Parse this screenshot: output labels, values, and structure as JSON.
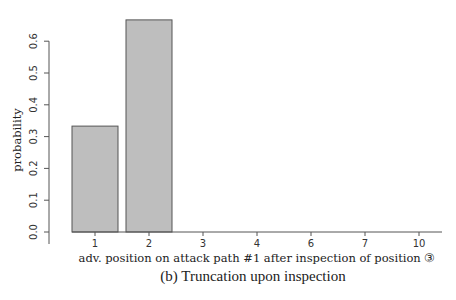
{
  "chart_data": {
    "type": "bar",
    "title": "",
    "caption": "(b) Truncation upon inspection",
    "xlabel": "adv. position on attack path #1 after inspection of position ③",
    "ylabel": "probability",
    "categories": [
      "1",
      "2",
      "3",
      "4",
      "6",
      "7",
      "10"
    ],
    "values": [
      0.333,
      0.667,
      0,
      0,
      0,
      0,
      0
    ],
    "ylim": [
      0,
      0.68
    ],
    "yticks": [
      0.0,
      0.1,
      0.2,
      0.3,
      0.4,
      0.5,
      0.6
    ],
    "ytick_labels": [
      "0.0",
      "0.1",
      "0.2",
      "0.3",
      "0.4",
      "0.5",
      "0.6"
    ],
    "grid": false,
    "legend": null,
    "colors": {
      "bar_fill": "#bebebe",
      "bar_border": "#555555",
      "axis": "#555555"
    }
  },
  "figure": {
    "caption": "(b) Truncation upon inspection"
  }
}
